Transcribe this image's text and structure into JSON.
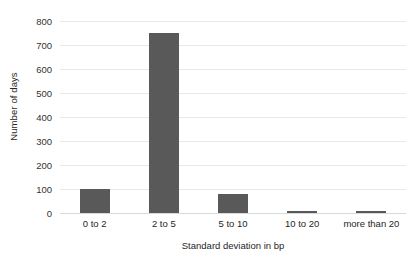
{
  "chart_data": {
    "type": "bar",
    "title": "",
    "subtitle": "",
    "xlabel": "Standard deviation in bp",
    "ylabel": "Number of days",
    "categories": [
      "0 to 2",
      "2 to 5",
      "5 to 10",
      "10 to 20",
      "more than 20"
    ],
    "values": [
      100,
      750,
      80,
      10,
      10
    ],
    "ylim": [
      0,
      800
    ],
    "ytick_values": [
      0,
      100,
      200,
      300,
      400,
      500,
      600,
      700,
      800
    ],
    "ytick_labels": [
      "0",
      "100",
      "200",
      "300",
      "400",
      "500",
      "600",
      "700",
      "800"
    ],
    "grid": "horizontal",
    "legend": "none",
    "annotations": [],
    "series": [
      {
        "name": "Number of days",
        "values": [
          100,
          750,
          80,
          10,
          10
        ]
      }
    ]
  },
  "style": {
    "bar_color": "#595959",
    "grid_color": "#e8e8e8",
    "baseline_color": "#d9d9d9",
    "background_color": "#ffffff",
    "text_color": "#262626"
  }
}
